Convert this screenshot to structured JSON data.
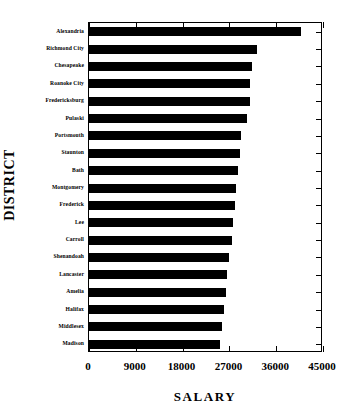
{
  "chart_data": {
    "type": "bar",
    "orientation": "horizontal",
    "title": "",
    "xlabel": "SALARY",
    "ylabel": "DISTRICT",
    "xlim": [
      0,
      45000
    ],
    "xticks": [
      "0",
      "9000",
      "18000",
      "27000",
      "36000",
      "45000"
    ],
    "xtick_values": [
      0,
      9000,
      18000,
      27000,
      36000,
      45000
    ],
    "grid": false,
    "legend": null,
    "bar_color": "#000000",
    "background_color": "#ffffff",
    "axis_color": "#000000",
    "categories": [
      "Alexandria",
      "Richmond City",
      "Chesapeake",
      "Roanoke City",
      "Fredericksburg",
      "Pulaski",
      "Portsmouth",
      "Staunton",
      "Bath",
      "Montgomery",
      "Frederick",
      "Lee",
      "Carroll",
      "Shenandoah",
      "Lancaster",
      "Amelia",
      "Halifax",
      "Middlesex",
      "Madison"
    ],
    "values": [
      40800,
      32300,
      31350,
      30900,
      30950,
      30400,
      29250,
      29050,
      28650,
      28250,
      28100,
      27700,
      27500,
      26900,
      26550,
      26350,
      25950,
      25600,
      25200
    ]
  }
}
